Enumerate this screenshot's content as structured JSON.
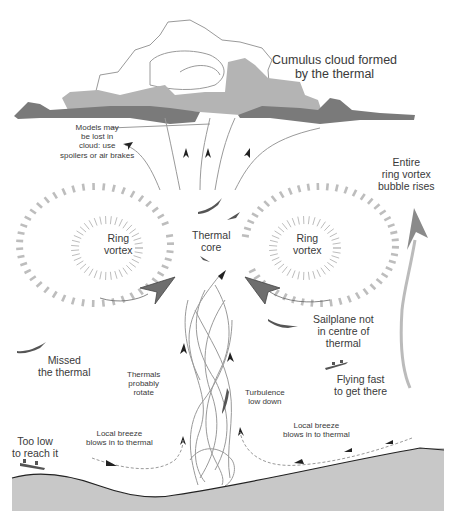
{
  "diagram": {
    "title_fragment_visible": false,
    "labels": {
      "cloud": [
        "Cumulus cloud formed",
        "by the thermal"
      ],
      "models_lost": [
        "Models may",
        "be lost in",
        "cloud: use",
        "spoilers or air brakes"
      ],
      "entire_ring": [
        "Entire",
        "ring vortex",
        "bubble rises"
      ],
      "ring_vortex_left": [
        "Ring",
        "vortex"
      ],
      "thermal_core": [
        "Thermal",
        "core"
      ],
      "ring_vortex_right": [
        "Ring",
        "vortex"
      ],
      "sailplane_not_centre": [
        "Sailplane not",
        "in centre of",
        "thermal"
      ],
      "missed_thermal": [
        "Missed",
        "the thermal"
      ],
      "thermals_rotate": [
        "Thermals",
        "probably",
        "rotate"
      ],
      "turbulence": [
        "Turbulence",
        "low down"
      ],
      "flying_fast": [
        "Flying fast",
        "to get there"
      ],
      "breeze_left": [
        "Local breeze",
        "blows in to thermal"
      ],
      "breeze_right": [
        "Local breeze",
        "blows in to thermal"
      ],
      "too_low": [
        "Too low",
        "to reach it"
      ]
    },
    "colors": {
      "cloud_light": "#b4b4b4",
      "cloud_dark": "#7a7a7a",
      "cloud_outline": "#9a9a9a",
      "ground": "#c8c8c8",
      "ground_edge": "#222222",
      "vortex_dash": "#bdbdbd",
      "big_arrow": "#6e6e6e",
      "flow_line": "#9a9a9a",
      "text": "#3a3a3a"
    }
  }
}
